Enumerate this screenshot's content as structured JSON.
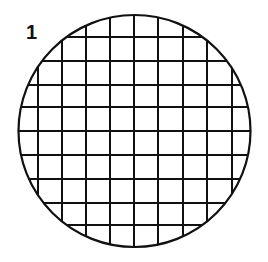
{
  "figure": {
    "label": "1",
    "shape": "circle",
    "circle": {
      "cx": 134.5,
      "cy": 131,
      "r": 116
    },
    "grid": {
      "vertical_lines_x": [
        38,
        62,
        86,
        110,
        134,
        158,
        183,
        207,
        232
      ],
      "horizontal_lines_y": [
        37,
        61,
        85,
        107,
        131,
        155,
        179,
        203,
        225
      ]
    },
    "colors": {
      "stroke": "#111111",
      "background": "#ffffff"
    }
  }
}
